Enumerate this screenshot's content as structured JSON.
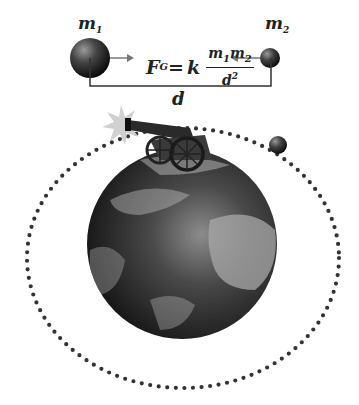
{
  "diagram": {
    "mass1": {
      "symbol": "m",
      "sub": "1"
    },
    "mass2": {
      "symbol": "m",
      "sub": "2"
    },
    "formula": {
      "lhs": "F",
      "lhs_sub": "G",
      "equals": "=",
      "constant": "k",
      "numerator": "m",
      "num_sub1": "1",
      "numerator2": "m",
      "num_sub2": "2",
      "denominator": "d",
      "den_sup": "2"
    },
    "distance_label": "d",
    "elements": [
      "mass-1-sphere",
      "mass-2-sphere",
      "force-arrows",
      "distance-bracket",
      "earth-globe",
      "cannon",
      "muzzle-flash",
      "cannonball",
      "dotted-orbit"
    ],
    "colors": {
      "ink": "#222222",
      "orbit_dots": "#333333",
      "sphere_dark": "#1a1a1a",
      "sphere_light": "#8a8a8a"
    }
  }
}
